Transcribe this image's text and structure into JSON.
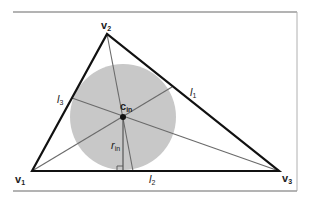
{
  "figure": {
    "colors": {
      "frame": "#9a9a9a",
      "triangle": "#111111",
      "bisector": "#6a6a6a",
      "incircle_fill": "#c8c8c8",
      "center_dot": "#111111"
    },
    "vertices": [
      {
        "id": "v1",
        "label": "v",
        "sub": "1",
        "x": 32,
        "y": 171
      },
      {
        "id": "v2",
        "label": "v",
        "sub": "2",
        "x": 107,
        "y": 34
      },
      {
        "id": "v3",
        "label": "v",
        "sub": "3",
        "x": 279,
        "y": 171
      }
    ],
    "incircle": {
      "label": "c",
      "sub": "in",
      "cx": 123,
      "cy": 117,
      "r": 53
    },
    "radius": {
      "label": "r",
      "sub": "in"
    },
    "bisector_feet": [
      {
        "id": "l1",
        "label": "l",
        "sub": "1",
        "x": 172,
        "y": 87
      },
      {
        "id": "l2",
        "label": "l",
        "sub": "2",
        "x": 133,
        "y": 171
      },
      {
        "id": "l3",
        "label": "l",
        "sub": "3",
        "x": 72,
        "y": 98
      }
    ]
  }
}
